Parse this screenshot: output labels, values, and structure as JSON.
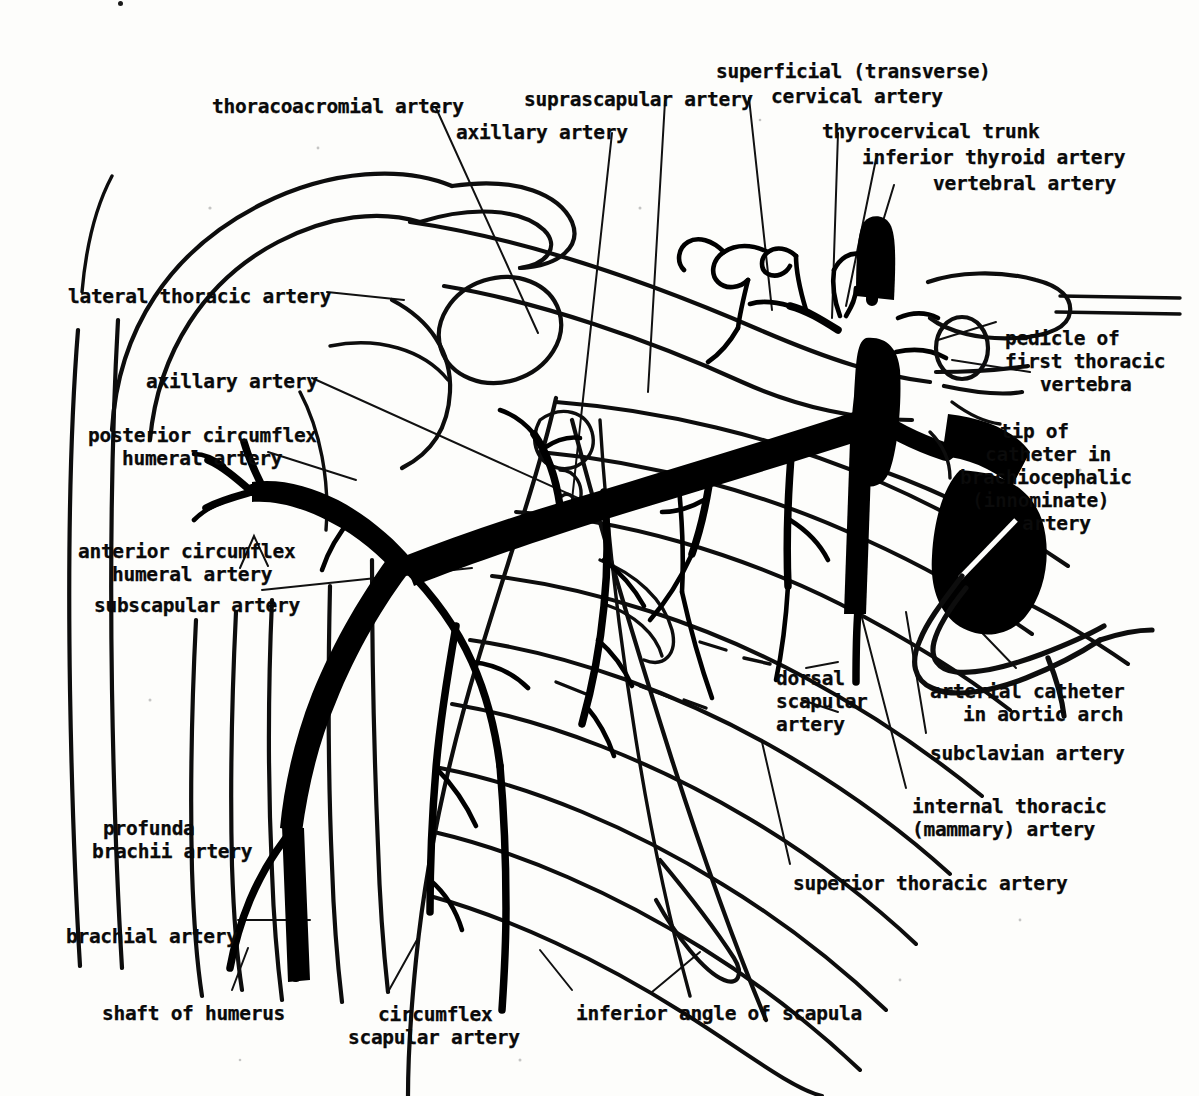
{
  "figure": {
    "style": "black-and-white line drawing / arteriogram tracing",
    "width": 1199,
    "height": 1096,
    "background_color": "#fdfdfb",
    "ink_color": "#000000"
  },
  "labels": [
    {
      "id": "thoracoacromial-artery",
      "text": "thoracoacromial artery",
      "x": 212,
      "y": 95,
      "align": "left"
    },
    {
      "id": "suprascapular-artery",
      "text": "suprascapular artery",
      "x": 524,
      "y": 88,
      "align": "left"
    },
    {
      "id": "superficial-cervical-artery-1",
      "text": "superficial (transverse)",
      "x": 716,
      "y": 60,
      "align": "left"
    },
    {
      "id": "superficial-cervical-artery-2",
      "text": "cervical artery",
      "x": 771,
      "y": 85,
      "align": "left"
    },
    {
      "id": "axillary-artery-upper",
      "text": "axillary artery",
      "x": 456,
      "y": 121,
      "align": "left"
    },
    {
      "id": "thyrocervical-trunk",
      "text": "thyrocervical trunk",
      "x": 822,
      "y": 120,
      "align": "left"
    },
    {
      "id": "inferior-thyroid-artery",
      "text": "inferior thyroid artery",
      "x": 862,
      "y": 146,
      "align": "left"
    },
    {
      "id": "vertebral-artery",
      "text": "vertebral artery",
      "x": 933,
      "y": 172,
      "align": "left"
    },
    {
      "id": "lateral-thoracic-artery",
      "text": "lateral thoracic artery",
      "x": 68,
      "y": 285,
      "align": "left"
    },
    {
      "id": "pedicle-line-1",
      "text": "pedicle of",
      "x": 1005,
      "y": 327,
      "align": "left"
    },
    {
      "id": "pedicle-line-2",
      "text": "first thoracic",
      "x": 1005,
      "y": 350,
      "align": "left"
    },
    {
      "id": "pedicle-line-3",
      "text": "vertebra",
      "x": 1040,
      "y": 373,
      "align": "left"
    },
    {
      "id": "axillary-artery-left",
      "text": "axillary artery",
      "x": 146,
      "y": 370,
      "align": "left"
    },
    {
      "id": "tip-catheter-line-1",
      "text": "tip of",
      "x": 1000,
      "y": 420,
      "align": "left"
    },
    {
      "id": "tip-catheter-line-2",
      "text": "catheter in",
      "x": 985,
      "y": 443,
      "align": "left"
    },
    {
      "id": "tip-catheter-line-3",
      "text": "brachiocephalic",
      "x": 960,
      "y": 466,
      "align": "left"
    },
    {
      "id": "tip-catheter-line-4",
      "text": "(innominate)",
      "x": 972,
      "y": 489,
      "align": "left"
    },
    {
      "id": "tip-catheter-line-5",
      "text": "artery",
      "x": 1022,
      "y": 512,
      "align": "left"
    },
    {
      "id": "posterior-circumflex-line-1",
      "text": "posterior circumflex",
      "x": 88,
      "y": 424,
      "align": "left"
    },
    {
      "id": "posterior-circumflex-line-2",
      "text": "humeral artery",
      "x": 122,
      "y": 447,
      "align": "left"
    },
    {
      "id": "anterior-circumflex-line-1",
      "text": "anterior circumflex",
      "x": 78,
      "y": 540,
      "align": "left"
    },
    {
      "id": "anterior-circumflex-line-2",
      "text": "humeral artery",
      "x": 112,
      "y": 563,
      "align": "left"
    },
    {
      "id": "subscapular-artery",
      "text": "subscapular artery",
      "x": 94,
      "y": 594,
      "align": "left"
    },
    {
      "id": "dorsal-scapular-line-1",
      "text": "dorsal",
      "x": 776,
      "y": 667,
      "align": "left"
    },
    {
      "id": "dorsal-scapular-line-2",
      "text": "scapular",
      "x": 776,
      "y": 690,
      "align": "left"
    },
    {
      "id": "dorsal-scapular-line-3",
      "text": "artery",
      "x": 776,
      "y": 713,
      "align": "left"
    },
    {
      "id": "arterial-catheter-line-1",
      "text": "arterial catheter",
      "x": 930,
      "y": 680,
      "align": "left"
    },
    {
      "id": "arterial-catheter-line-2",
      "text": "in aortic arch",
      "x": 963,
      "y": 703,
      "align": "left"
    },
    {
      "id": "subclavian-artery",
      "text": "subclavian artery",
      "x": 930,
      "y": 742,
      "align": "left"
    },
    {
      "id": "internal-thoracic-line-1",
      "text": "internal thoracic",
      "x": 912,
      "y": 795,
      "align": "left"
    },
    {
      "id": "internal-thoracic-line-2",
      "text": "(mammary) artery",
      "x": 912,
      "y": 818,
      "align": "left"
    },
    {
      "id": "profunda-brachii-line-1",
      "text": "profunda",
      "x": 103,
      "y": 817,
      "align": "left"
    },
    {
      "id": "profunda-brachii-line-2",
      "text": "brachii artery",
      "x": 92,
      "y": 840,
      "align": "left"
    },
    {
      "id": "superior-thoracic-artery",
      "text": "superior thoracic artery",
      "x": 793,
      "y": 872,
      "align": "left"
    },
    {
      "id": "brachial-artery",
      "text": "brachial artery",
      "x": 66,
      "y": 925,
      "align": "left"
    },
    {
      "id": "shaft-of-humerus",
      "text": "shaft of humerus",
      "x": 102,
      "y": 1002,
      "align": "left"
    },
    {
      "id": "circumflex-scapular-line-1",
      "text": "circumflex",
      "x": 378,
      "y": 1003,
      "align": "left"
    },
    {
      "id": "circumflex-scapular-line-2",
      "text": "scapular artery",
      "x": 348,
      "y": 1026,
      "align": "left"
    },
    {
      "id": "inferior-angle-of-scapula",
      "text": "inferior angle of scapula",
      "x": 576,
      "y": 1002,
      "align": "left"
    }
  ],
  "anatomy": {
    "major_vessels": [
      "subclavian artery",
      "axillary artery",
      "brachial artery",
      "brachiocephalic (innominate) artery",
      "aortic arch",
      "vertebral artery",
      "thyrocervical trunk",
      "inferior thyroid artery",
      "superficial (transverse) cervical artery",
      "suprascapular artery",
      "internal thoracic (mammary) artery",
      "dorsal scapular artery",
      "superior thoracic artery",
      "thoracoacromial artery",
      "lateral thoracic artery",
      "subscapular artery",
      "circumflex scapular artery",
      "anterior circumflex humeral artery",
      "posterior circumflex humeral artery",
      "profunda brachii artery"
    ],
    "skeletal_structures": [
      "shaft of humerus",
      "scapula",
      "inferior angle of scapula",
      "clavicle",
      "ribs",
      "pedicle of first thoracic vertebra"
    ],
    "devices": [
      "arterial catheter in aortic arch",
      "tip of catheter in brachiocephalic (innominate) artery"
    ]
  }
}
